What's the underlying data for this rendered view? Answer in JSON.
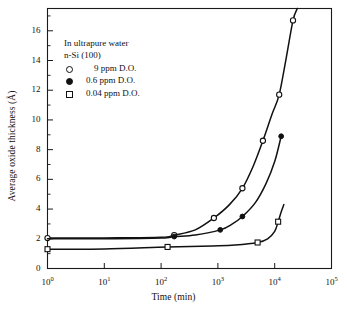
{
  "chart_data": {
    "type": "line",
    "title": "",
    "xlabel": "Time (min)",
    "ylabel": "Average oxide thickness (Å)",
    "xscale": "log",
    "yscale": "linear",
    "xlim": [
      1,
      100000
    ],
    "ylim": [
      0,
      17.5
    ],
    "grid": false,
    "legend_position": "upper-left-inside",
    "annotations": [
      "In ultrapure water",
      "n-Si (100)"
    ],
    "xticks": [
      {
        "value": 1,
        "label": "10",
        "exp": "0"
      },
      {
        "value": 10,
        "label": "10",
        "exp": "1"
      },
      {
        "value": 100,
        "label": "10",
        "exp": "2"
      },
      {
        "value": 1000,
        "label": "10",
        "exp": "3"
      },
      {
        "value": 10000,
        "label": "10",
        "exp": "4"
      },
      {
        "value": 100000,
        "label": "10",
        "exp": "5"
      }
    ],
    "yticks": [
      0,
      2,
      4,
      6,
      8,
      10,
      12,
      14,
      16
    ],
    "yminorticks": [
      1,
      3,
      5,
      7,
      9,
      11,
      13,
      15,
      17
    ],
    "series": [
      {
        "name": "9 ppm D.O.",
        "marker": "open-circle",
        "points": [
          {
            "x": 1,
            "y": 2.05,
            "marker": true
          },
          {
            "x": 10,
            "y": 2.06,
            "marker": false
          },
          {
            "x": 100,
            "y": 2.1,
            "marker": false
          },
          {
            "x": 170,
            "y": 2.25,
            "marker": true
          },
          {
            "x": 400,
            "y": 2.6,
            "marker": false
          },
          {
            "x": 850,
            "y": 3.4,
            "marker": true
          },
          {
            "x": 1600,
            "y": 4.3,
            "marker": false
          },
          {
            "x": 2700,
            "y": 5.4,
            "marker": true
          },
          {
            "x": 4200,
            "y": 6.9,
            "marker": false
          },
          {
            "x": 6200,
            "y": 8.6,
            "marker": true
          },
          {
            "x": 9000,
            "y": 10.4,
            "marker": false
          },
          {
            "x": 12000,
            "y": 11.7,
            "marker": true
          },
          {
            "x": 16000,
            "y": 14.2,
            "marker": false
          },
          {
            "x": 21000,
            "y": 16.7,
            "marker": true
          },
          {
            "x": 25000,
            "y": 17.5,
            "marker": false
          }
        ]
      },
      {
        "name": "0.6 ppm D.O.",
        "marker": "filled-circle",
        "points": [
          {
            "x": 1,
            "y": 2.0,
            "marker": false
          },
          {
            "x": 10,
            "y": 2.0,
            "marker": false
          },
          {
            "x": 100,
            "y": 2.05,
            "marker": false
          },
          {
            "x": 170,
            "y": 2.15,
            "marker": true
          },
          {
            "x": 400,
            "y": 2.25,
            "marker": false
          },
          {
            "x": 1100,
            "y": 2.6,
            "marker": true
          },
          {
            "x": 1800,
            "y": 3.0,
            "marker": false
          },
          {
            "x": 2700,
            "y": 3.5,
            "marker": true
          },
          {
            "x": 4500,
            "y": 4.4,
            "marker": false
          },
          {
            "x": 7000,
            "y": 5.7,
            "marker": false
          },
          {
            "x": 10000,
            "y": 7.2,
            "marker": false
          },
          {
            "x": 13000,
            "y": 8.9,
            "marker": true
          }
        ]
      },
      {
        "name": "0.04 ppm D.O.",
        "marker": "open-square",
        "points": [
          {
            "x": 1,
            "y": 1.3,
            "marker": true
          },
          {
            "x": 10,
            "y": 1.32,
            "marker": false
          },
          {
            "x": 130,
            "y": 1.45,
            "marker": true
          },
          {
            "x": 800,
            "y": 1.52,
            "marker": false
          },
          {
            "x": 2000,
            "y": 1.58,
            "marker": false
          },
          {
            "x": 5000,
            "y": 1.75,
            "marker": true
          },
          {
            "x": 7500,
            "y": 2.0,
            "marker": false
          },
          {
            "x": 10000,
            "y": 2.5,
            "marker": false
          },
          {
            "x": 11500,
            "y": 3.15,
            "marker": true
          },
          {
            "x": 13000,
            "y": 3.8,
            "marker": false
          },
          {
            "x": 14500,
            "y": 4.3,
            "marker": false
          }
        ]
      }
    ]
  },
  "legend": {
    "header_lines": [
      "In ultrapure water",
      "n-Si (100)"
    ],
    "entries": [
      {
        "marker": "open-circle",
        "label": "9 ppm D.O."
      },
      {
        "marker": "filled-circle",
        "label": "0.6 ppm D.O."
      },
      {
        "marker": "open-square",
        "label": "0.04 ppm D.O."
      }
    ]
  },
  "colors": {
    "axis": "#1a1a1a",
    "curve": "#111111",
    "background": "#ffffff",
    "marker_fill_open": "#ffffff",
    "marker_fill_closed": "#111111"
  }
}
